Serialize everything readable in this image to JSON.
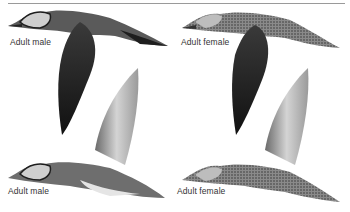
{
  "plate": {
    "subject": "Baikal Teal illustration plate",
    "illustrations": [
      {
        "position": "top-left",
        "label": "Adult male",
        "pose": "flying, wings down"
      },
      {
        "position": "top-right",
        "label": "Adult female",
        "pose": "flying, wings down"
      },
      {
        "position": "bottom-left",
        "label": "Adult male",
        "pose": "flying, wings up"
      },
      {
        "position": "bottom-right",
        "label": "Adult female",
        "pose": "flying, wings up"
      }
    ]
  },
  "colors": {
    "rule": "#9a9a9a",
    "dark_plumage": "#1e1e1e",
    "mid_plumage": "#5a5a5a",
    "light_plumage": "#bdbdbd",
    "wing_light": "#cfcfcf"
  }
}
